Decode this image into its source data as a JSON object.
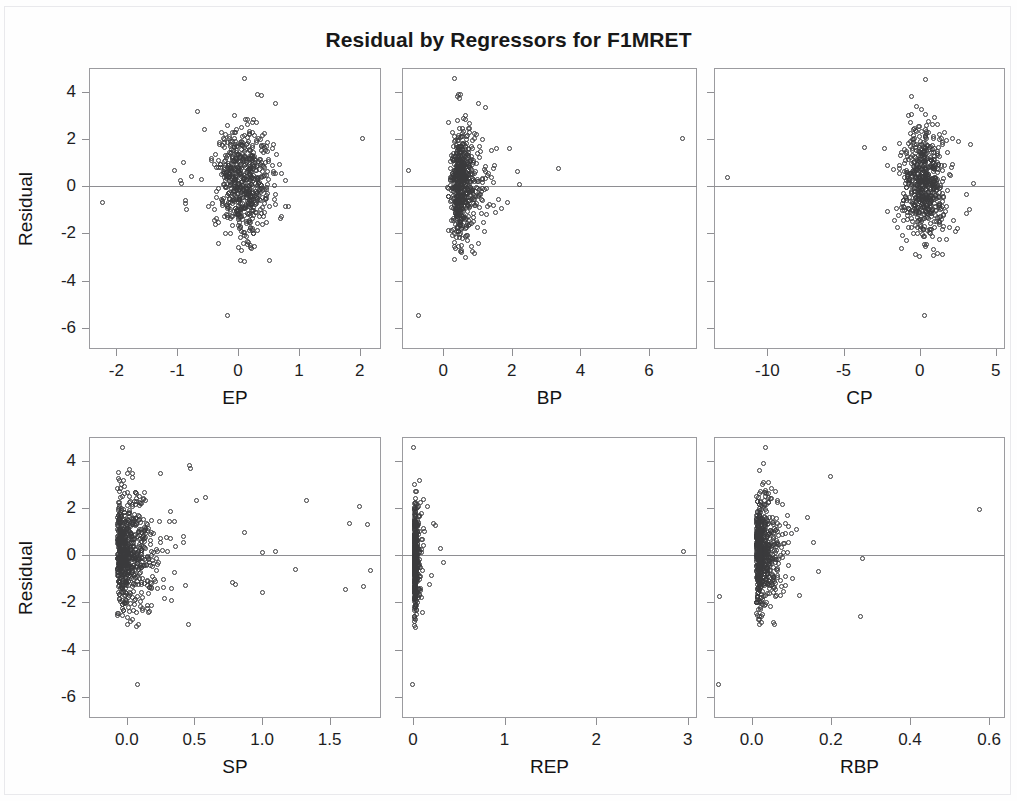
{
  "chart_data": {
    "type": "scatter",
    "title": "Residual by Regressors for F1MRET",
    "layout": {
      "rows": 2,
      "cols": 3,
      "grid": false,
      "legend": null
    },
    "ylabel": "Residual",
    "ylim": [
      -6.9,
      5.0
    ],
    "yticks": [
      4,
      2,
      0,
      -2,
      -4,
      -6
    ],
    "yticklabels": [
      "4",
      "2",
      "0",
      "-2",
      "-4",
      "-6"
    ],
    "reference_line": {
      "y": 0,
      "style": "solid",
      "color": "#8e8e92"
    },
    "marker": {
      "shape": "open-circle",
      "size_px": 5,
      "color": "#3a3a3c"
    },
    "panels": [
      {
        "id": "panel-ep",
        "xlabel": "EP",
        "xlim": [
          -2.45,
          2.35
        ],
        "xticks": [
          -2,
          -1,
          0,
          1,
          2
        ],
        "xticklabels": [
          "-2",
          "-1",
          "0",
          "1",
          "2"
        ],
        "n_points": 620,
        "cluster": {
          "x_center": 0.08,
          "x_spread": 0.22,
          "y_center": 0.15,
          "y_spread": 1.15,
          "y_min": -3.2,
          "y_max": 4.0
        },
        "outliers": [
          {
            "x": -2.23,
            "y": -0.7
          },
          {
            "x": -0.67,
            "y": 3.15
          },
          {
            "x": 2.05,
            "y": 2.0
          },
          {
            "x": -0.18,
            "y": -5.5
          },
          {
            "x": -1.04,
            "y": 0.68
          },
          {
            "x": -0.9,
            "y": 1.02
          },
          {
            "x": -0.95,
            "y": 0.25
          },
          {
            "x": -0.93,
            "y": 0.12
          },
          {
            "x": -0.86,
            "y": -0.6
          },
          {
            "x": -0.87,
            "y": -0.75
          },
          {
            "x": -0.76,
            "y": 0.4
          },
          {
            "x": -0.6,
            "y": 0.3
          },
          {
            "x": 0.1,
            "y": 4.55
          },
          {
            "x": 0.32,
            "y": 3.9
          },
          {
            "x": 0.38,
            "y": 3.85
          },
          {
            "x": 0.72,
            "y": 0.55
          },
          {
            "x": 0.83,
            "y": -0.85
          },
          {
            "x": 0.78,
            "y": 0.25
          }
        ]
      },
      {
        "id": "panel-bp",
        "xlabel": "BP",
        "xlim": [
          -1.2,
          7.4
        ],
        "xticks": [
          0,
          2,
          4,
          6
        ],
        "xticklabels": [
          "0",
          "2",
          "4",
          "6"
        ],
        "n_points": 620,
        "cluster": {
          "x_center": 0.42,
          "x_spread": 0.36,
          "y_center": 0.1,
          "y_spread": 1.15,
          "y_min": -3.1,
          "y_max": 4.0
        },
        "outliers": [
          {
            "x": -0.72,
            "y": -5.5
          },
          {
            "x": 6.98,
            "y": 2.0
          },
          {
            "x": 3.35,
            "y": 0.75
          },
          {
            "x": -1.02,
            "y": 0.65
          },
          {
            "x": 0.32,
            "y": 4.55
          },
          {
            "x": 0.45,
            "y": 3.9
          },
          {
            "x": 0.5,
            "y": 3.88
          },
          {
            "x": 1.02,
            "y": 3.5
          },
          {
            "x": 1.22,
            "y": 3.35
          },
          {
            "x": 2.18,
            "y": 0.6
          },
          {
            "x": 2.22,
            "y": 0.05
          },
          {
            "x": 1.6,
            "y": -0.55
          },
          {
            "x": 1.52,
            "y": -1.1
          },
          {
            "x": 1.46,
            "y": -0.82
          }
        ]
      },
      {
        "id": "panel-cp",
        "xlabel": "CP",
        "xlim": [
          -13.5,
          5.6
        ],
        "xticks": [
          -10,
          -5,
          0,
          5
        ],
        "xticklabels": [
          "-10",
          "-5",
          "0",
          "5"
        ],
        "n_points": 620,
        "cluster": {
          "x_center": 0.3,
          "x_spread": 0.75,
          "y_center": 0.1,
          "y_spread": 1.18,
          "y_min": -3.2,
          "y_max": 4.1
        },
        "outliers": [
          {
            "x": -12.6,
            "y": 0.35
          },
          {
            "x": 0.3,
            "y": -5.5
          },
          {
            "x": -3.6,
            "y": 1.65
          },
          {
            "x": -2.3,
            "y": 1.6
          },
          {
            "x": 0.4,
            "y": 4.5
          },
          {
            "x": -0.55,
            "y": 3.8
          },
          {
            "x": 2.55,
            "y": 1.9
          },
          {
            "x": 3.35,
            "y": 1.75
          },
          {
            "x": 3.5,
            "y": 0.1
          },
          {
            "x": 3.1,
            "y": -0.35
          },
          {
            "x": 3.25,
            "y": -1.0
          },
          {
            "x": 3.05,
            "y": -1.15
          },
          {
            "x": 2.2,
            "y": -1.45
          }
        ]
      },
      {
        "id": "panel-sp",
        "xlabel": "SP",
        "xlim": [
          -0.28,
          1.88
        ],
        "xticks": [
          0.0,
          0.5,
          1.0,
          1.5
        ],
        "xticklabels": [
          "0.0",
          "0.5",
          "1.0",
          "1.5"
        ],
        "n_points": 700,
        "cluster": {
          "x_center": -0.07,
          "x_spread": 0.14,
          "y_center": 0.05,
          "y_spread": 1.2,
          "y_min": -3.1,
          "y_max": 3.8
        },
        "outliers": [
          {
            "x": 0.08,
            "y": -5.5
          },
          {
            "x": -0.03,
            "y": 4.55
          },
          {
            "x": 0.46,
            "y": 3.8
          },
          {
            "x": 0.47,
            "y": 3.65
          },
          {
            "x": 0.25,
            "y": 3.45
          },
          {
            "x": 0.58,
            "y": 2.45
          },
          {
            "x": 1.33,
            "y": 2.3
          },
          {
            "x": 1.72,
            "y": 2.05
          },
          {
            "x": 1.65,
            "y": 1.35
          },
          {
            "x": 1.78,
            "y": 1.3
          },
          {
            "x": 0.87,
            "y": 0.95
          },
          {
            "x": 1.0,
            "y": 0.1
          },
          {
            "x": 1.1,
            "y": 0.15
          },
          {
            "x": 1.25,
            "y": -0.6
          },
          {
            "x": 1.0,
            "y": -1.6
          },
          {
            "x": 1.62,
            "y": -1.45
          },
          {
            "x": 1.8,
            "y": -0.65
          },
          {
            "x": 1.75,
            "y": -1.35
          },
          {
            "x": 0.78,
            "y": -1.15
          },
          {
            "x": 0.8,
            "y": -1.25
          }
        ]
      },
      {
        "id": "panel-rep",
        "xlabel": "REP",
        "xlim": [
          -0.12,
          3.1
        ],
        "xticks": [
          0,
          1,
          2,
          3
        ],
        "xticklabels": [
          "0",
          "1",
          "2",
          "3"
        ],
        "n_points": 430,
        "cluster": {
          "x_center": 0.012,
          "x_spread": 0.028,
          "y_center": 0.0,
          "y_spread": 1.2,
          "y_min": -3.1,
          "y_max": 3.9
        },
        "outliers": [
          {
            "x": -0.01,
            "y": -5.5
          },
          {
            "x": 0.0,
            "y": 4.55
          },
          {
            "x": 2.95,
            "y": 0.15
          },
          {
            "x": 0.11,
            "y": 2.35
          },
          {
            "x": 0.16,
            "y": 2.05
          },
          {
            "x": 0.22,
            "y": 1.35
          },
          {
            "x": 0.24,
            "y": 1.25
          },
          {
            "x": 0.3,
            "y": 0.3
          },
          {
            "x": 0.33,
            "y": -0.3
          },
          {
            "x": 0.2,
            "y": -0.85
          },
          {
            "x": 0.18,
            "y": -1.25
          }
        ]
      },
      {
        "id": "panel-rbp",
        "xlabel": "RBP",
        "xlim": [
          -0.095,
          0.64
        ],
        "xticks": [
          0.0,
          0.2,
          0.4,
          0.6
        ],
        "xticklabels": [
          "0.0",
          "0.2",
          "0.4",
          "0.6"
        ],
        "n_points": 620,
        "cluster": {
          "x_center": 0.012,
          "x_spread": 0.028,
          "y_center": 0.1,
          "y_spread": 1.18,
          "y_min": -3.0,
          "y_max": 3.7
        },
        "outliers": [
          {
            "x": -0.085,
            "y": -5.5
          },
          {
            "x": 0.035,
            "y": 4.55
          },
          {
            "x": 0.2,
            "y": 3.35
          },
          {
            "x": 0.575,
            "y": 1.95
          },
          {
            "x": 0.28,
            "y": -0.15
          },
          {
            "x": 0.275,
            "y": -2.6
          },
          {
            "x": 0.03,
            "y": 3.9
          },
          {
            "x": 0.155,
            "y": 0.55
          },
          {
            "x": 0.17,
            "y": -0.7
          },
          {
            "x": 0.12,
            "y": -1.7
          },
          {
            "x": -0.082,
            "y": -1.75
          }
        ]
      }
    ]
  },
  "title": "Residual by Regressors for F1MRET",
  "axis": {
    "ylabel": "Residual"
  }
}
